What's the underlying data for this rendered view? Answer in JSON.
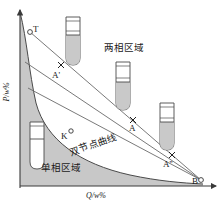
{
  "figure": {
    "type": "phase-diagram",
    "axes": {
      "y_label": "P/w%",
      "x_label": "Q/w%",
      "x_arrow": "right",
      "y_arrow": "up"
    },
    "regions": [
      {
        "id": "two-phase",
        "label": "两相区域",
        "shaded": false
      },
      {
        "id": "single-phase",
        "label": "单相区域",
        "shaded": true
      }
    ],
    "curve_label": "双节点曲线",
    "points": [
      {
        "id": "T",
        "label": "T",
        "marker": "open-circle",
        "x": 30,
        "y": 32
      },
      {
        "id": "A1",
        "label": "A'",
        "marker": "cross",
        "x": 61,
        "y": 65
      },
      {
        "id": "A",
        "label": "A",
        "marker": "cross",
        "x": 133,
        "y": 120
      },
      {
        "id": "A2",
        "label": "A''",
        "marker": "cross",
        "x": 173,
        "y": 156
      },
      {
        "id": "B",
        "label": "B",
        "marker": "open-circle",
        "x": 200,
        "y": 180
      },
      {
        "id": "K",
        "label": "K",
        "marker": "open-circle",
        "x": 71,
        "y": 133
      }
    ],
    "tie_lines": [
      {
        "id": "tie-1",
        "from": "T-node",
        "to": "B-node"
      },
      {
        "id": "tie-2",
        "from": "upper-2",
        "to": "B-node"
      },
      {
        "id": "tie-3",
        "from": "upper-3",
        "to": "B-node"
      }
    ],
    "test_tubes": [
      {
        "id": "tube-top",
        "x": 66,
        "y": 17,
        "fill_fraction": 0.55,
        "phases": 2
      },
      {
        "id": "tube-middle",
        "x": 116,
        "y": 62,
        "fill_fraction": 0.62,
        "phases": 2
      },
      {
        "id": "tube-right",
        "x": 160,
        "y": 103,
        "fill_fraction": 0.6,
        "phases": 2
      },
      {
        "id": "tube-left",
        "x": 30,
        "y": 122,
        "fill_fraction": 0.05,
        "phases": 1
      }
    ],
    "colors": {
      "shade": "#c8c8c8",
      "stroke": "#3a3a3a",
      "tube_fill": "#c9c9c9",
      "text": "#1a1a1a",
      "background": "#ffffff"
    }
  }
}
